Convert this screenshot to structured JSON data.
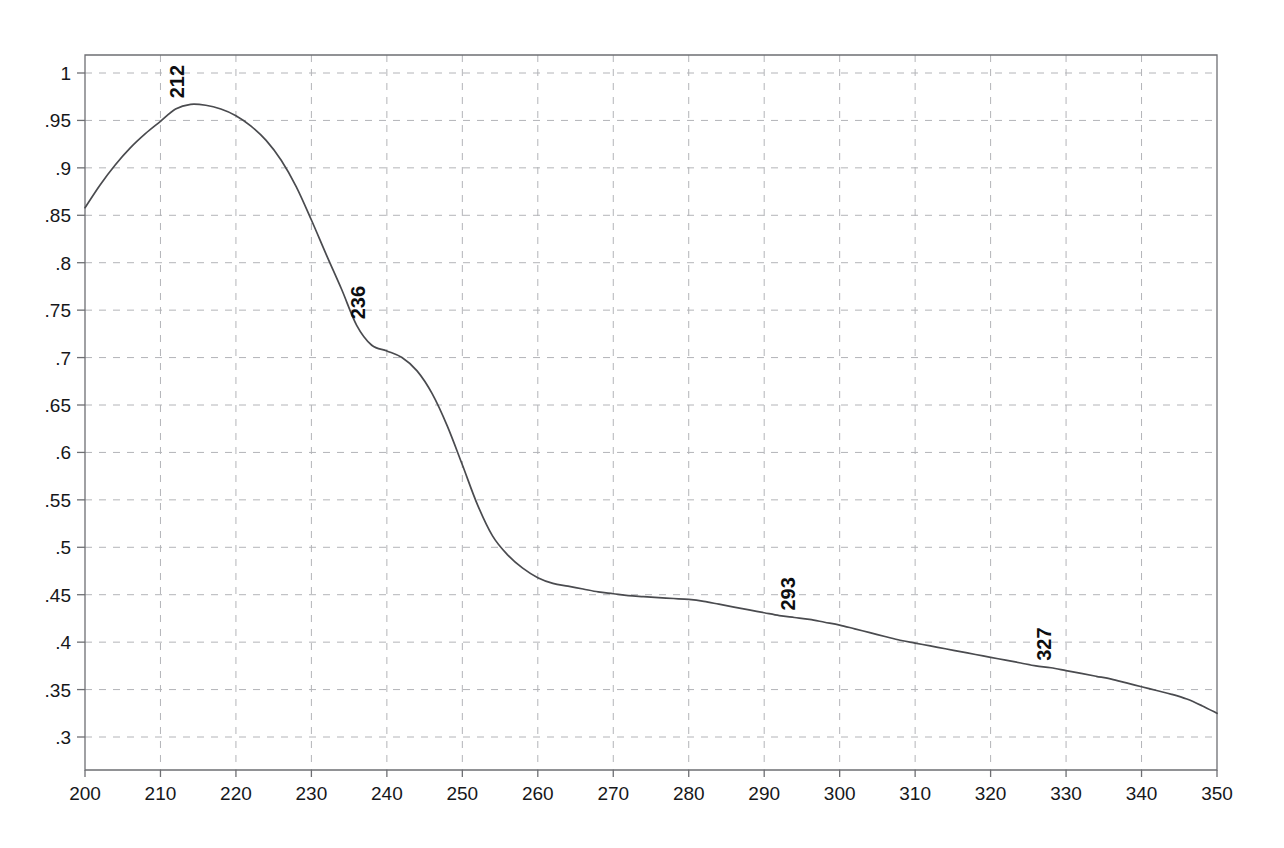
{
  "chart_data": {
    "type": "line",
    "title": "",
    "subtitle": "",
    "xlabel": "",
    "ylabel": "",
    "xlim": [
      200,
      350
    ],
    "ylim": [
      0.275,
      1.025
    ],
    "grid": true,
    "legend": "none",
    "x_ticks": [
      200,
      210,
      220,
      230,
      240,
      250,
      260,
      270,
      280,
      290,
      300,
      310,
      320,
      330,
      340,
      350
    ],
    "x_tick_labels": [
      "200",
      "210",
      "220",
      "230",
      "240",
      "250",
      "260",
      "270",
      "280",
      "290",
      "300",
      "310",
      "320",
      "330",
      "340",
      "350"
    ],
    "y_ticks": [
      1,
      0.95,
      0.9,
      0.85,
      0.8,
      0.75,
      0.7,
      0.65,
      0.6,
      0.55,
      0.5,
      0.45,
      0.4,
      0.35,
      0.3
    ],
    "y_tick_labels": [
      "1",
      ".95",
      ".9",
      ".85",
      ".8",
      ".75",
      ".7",
      ".65",
      ".6",
      ".55",
      ".5",
      ".45",
      ".4",
      ".35",
      ".3"
    ],
    "series": [
      {
        "name": "absorbance",
        "color": "#4a4b4f",
        "x": [
          200,
          202,
          204,
          206,
          208,
          210,
          212,
          214,
          216,
          218,
          220,
          222,
          224,
          226,
          228,
          230,
          232,
          234,
          236,
          238,
          240,
          242,
          244,
          246,
          248,
          250,
          252,
          254,
          256,
          258,
          260,
          262,
          264,
          266,
          268,
          270,
          272,
          274,
          276,
          278,
          280,
          282,
          284,
          286,
          288,
          290,
          292,
          294,
          296,
          298,
          300,
          302,
          304,
          306,
          308,
          310,
          312,
          314,
          316,
          318,
          320,
          322,
          324,
          326,
          328,
          330,
          332,
          334,
          336,
          338,
          340,
          342,
          344,
          346,
          348,
          350
        ],
        "y": [
          0.858,
          0.882,
          0.903,
          0.921,
          0.936,
          0.949,
          0.962,
          0.967,
          0.966,
          0.962,
          0.955,
          0.944,
          0.929,
          0.908,
          0.88,
          0.845,
          0.808,
          0.772,
          0.734,
          0.713,
          0.707,
          0.7,
          0.686,
          0.662,
          0.628,
          0.587,
          0.545,
          0.512,
          0.492,
          0.478,
          0.468,
          0.462,
          0.459,
          0.456,
          0.453,
          0.451,
          0.449,
          0.448,
          0.447,
          0.446,
          0.445,
          0.443,
          0.44,
          0.437,
          0.434,
          0.431,
          0.428,
          0.426,
          0.424,
          0.421,
          0.418,
          0.414,
          0.41,
          0.406,
          0.402,
          0.399,
          0.396,
          0.393,
          0.39,
          0.387,
          0.384,
          0.381,
          0.378,
          0.375,
          0.373,
          0.37,
          0.367,
          0.364,
          0.361,
          0.357,
          0.353,
          0.349,
          0.345,
          0.34,
          0.333,
          0.325
        ]
      }
    ],
    "annotations": [
      {
        "label": "212",
        "x": 212,
        "y": 0.967,
        "orientation": "vertical"
      },
      {
        "label": "236",
        "x": 236,
        "y": 0.734,
        "orientation": "vertical"
      },
      {
        "label": "293",
        "x": 293,
        "y": 0.427,
        "orientation": "vertical"
      },
      {
        "label": "327",
        "x": 327,
        "y": 0.374,
        "orientation": "vertical"
      }
    ]
  },
  "axes": {
    "x_axis_name": "x-axis",
    "y_axis_name": "y-axis"
  }
}
